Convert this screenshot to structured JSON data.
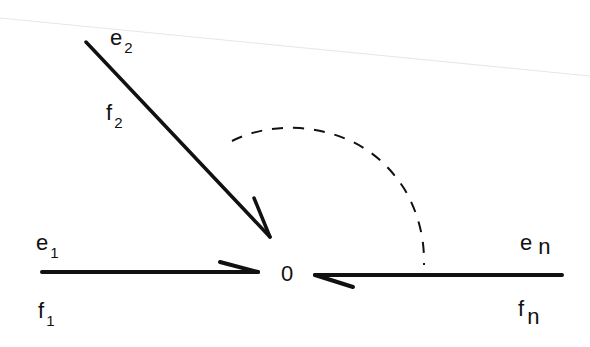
{
  "diagram": {
    "title": "",
    "junction": {
      "label": "0",
      "x": 289,
      "y": 272
    },
    "bonds": [
      {
        "id": "bond-1",
        "effort": "e",
        "flow": "f",
        "index": "1",
        "from": [
          42,
          272
        ],
        "to": [
          258,
          272
        ],
        "direction": "into-junction"
      },
      {
        "id": "bond-2",
        "effort": "e",
        "flow": "f",
        "index": "2",
        "from": [
          86,
          42
        ],
        "to": [
          270,
          237
        ],
        "direction": "into-junction"
      },
      {
        "id": "bond-n",
        "effort": "e",
        "flow": "f",
        "index": "n",
        "from": [
          562,
          275
        ],
        "to": [
          315,
          275
        ],
        "direction": "into-junction"
      }
    ],
    "arc": {
      "style": "dashed",
      "meaning": "additional bonds between 2 and n"
    },
    "colors": {
      "ink": "#111111",
      "background": "#ffffff"
    }
  },
  "labels": {
    "e2": {
      "base": "e",
      "sub": "2"
    },
    "f2": {
      "base": "f",
      "sub": "2"
    },
    "e1": {
      "base": "e",
      "sub": "1"
    },
    "f1": {
      "base": "f",
      "sub": "1"
    },
    "en": {
      "base": "e",
      "sub": "n"
    },
    "fn": {
      "base": "f",
      "sub": "n"
    },
    "junction": "0"
  }
}
